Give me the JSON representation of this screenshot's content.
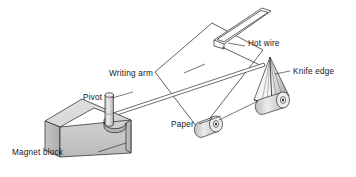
{
  "figure": {
    "kind": "technical-line-diagram",
    "background_color": "#ffffff",
    "line_color": "#1a1a1a",
    "shade_color": "#c9c9c9",
    "shade_dark_color": "#a6a6a6",
    "shade_light_color": "#e0e0e0"
  },
  "labels": {
    "writing_arm": "Writing arm",
    "pivot": "Pivot",
    "magnet_block": "Magnet block",
    "paper": "Paper",
    "hot_wire": "Hot wire",
    "knife_edge": "Knife edge"
  },
  "parts": [
    {
      "id": "magnet-block",
      "name": "Magnet block",
      "shaded": true
    },
    {
      "id": "pivot-post",
      "name": "Pivot",
      "shaded": true
    },
    {
      "id": "writing-arm",
      "name": "Writing arm",
      "shaded": false
    },
    {
      "id": "paper-sheet",
      "name": "Paper",
      "shaded": false
    },
    {
      "id": "hot-wire-frame",
      "name": "Hot wire",
      "shaded": false
    },
    {
      "id": "knife-edge-wedge",
      "name": "Knife edge",
      "shaded": true
    },
    {
      "id": "roller-front",
      "name": "roller",
      "shaded": true
    },
    {
      "id": "roller-rear",
      "name": "roller",
      "shaded": true
    }
  ]
}
